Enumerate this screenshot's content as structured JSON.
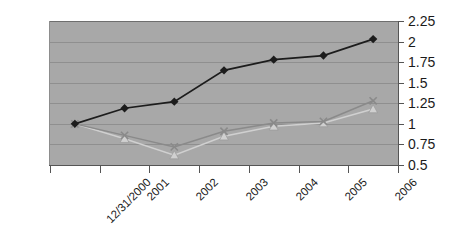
{
  "chart_data": {
    "type": "line",
    "title": "",
    "subtitle": "",
    "xlabel": "",
    "ylabel": "",
    "grid": true,
    "legend": "none",
    "categories": [
      "12/31/2000",
      "2001",
      "2002",
      "2003",
      "2004",
      "2005",
      "2006"
    ],
    "ylim": [
      0.5,
      2.25
    ],
    "ytick_step": 0.25,
    "yticks": [
      "2.25",
      "2",
      "1.75",
      "1.5",
      "1.25",
      "1",
      "0.75",
      "0.5"
    ],
    "ytick_values": [
      2.25,
      2,
      1.75,
      1.5,
      1.25,
      1,
      0.75,
      0.5
    ],
    "series": [
      {
        "name": "series-1",
        "marker": "diamond",
        "color": "#1c1c1c",
        "values": [
          1.0,
          1.19,
          1.27,
          1.65,
          1.78,
          1.83,
          2.03
        ]
      },
      {
        "name": "series-2",
        "marker": "x",
        "color": "#8a8a8a",
        "values": [
          1.0,
          0.86,
          0.72,
          0.91,
          1.01,
          1.03,
          1.28
        ]
      },
      {
        "name": "series-3",
        "marker": "triangle",
        "color": "#d0d0d0",
        "values": [
          1.0,
          0.82,
          0.62,
          0.85,
          0.97,
          1.01,
          1.18
        ]
      }
    ]
  },
  "colors": {
    "plot_background": "#a8a8a8",
    "page_background": "#ffffff",
    "gridline": "#8f8f8f",
    "axis": "#555555",
    "text": "#1a1a1a"
  }
}
